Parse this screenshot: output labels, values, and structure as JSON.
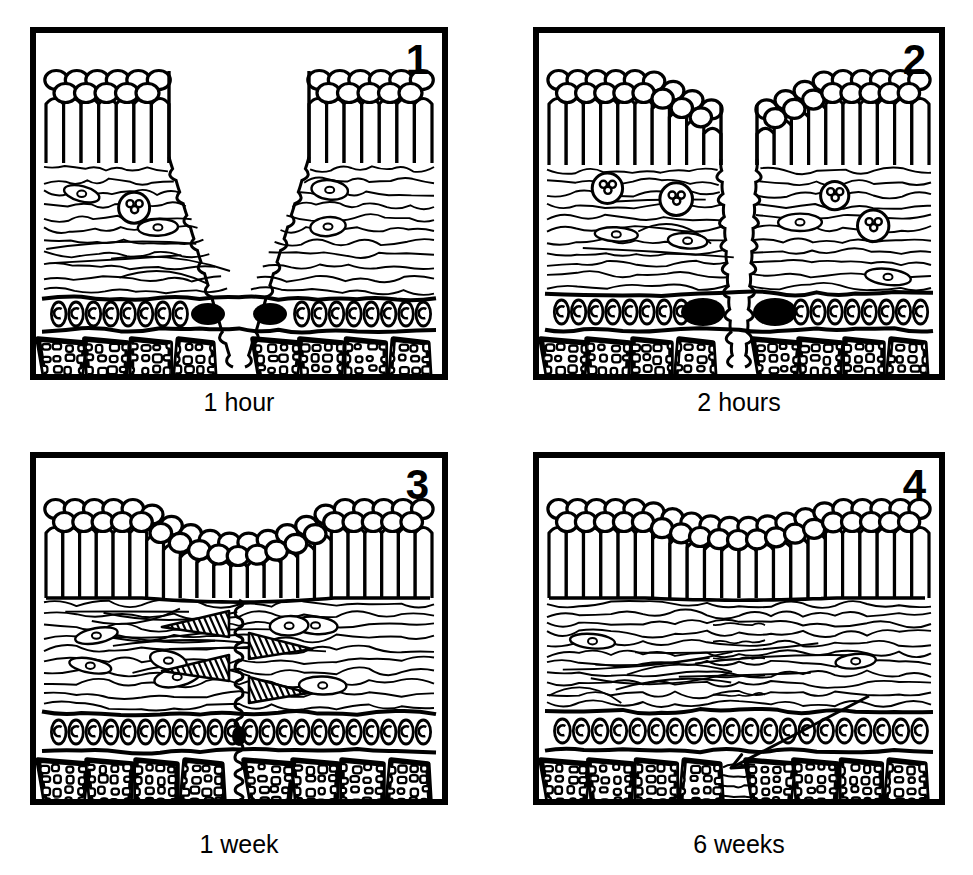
{
  "figure": {
    "background_color": "#ffffff",
    "ink_color": "#000000",
    "width": 973,
    "height": 875,
    "style": "black-and-white line drawing"
  },
  "panels": [
    {
      "id": "panel-1",
      "number": "1",
      "caption": "1 hour",
      "stage": "initial-incision",
      "x": 30,
      "y": 27,
      "w": 418,
      "h": 353,
      "caption_y": 388,
      "description": "Full-thickness V-shaped incision open from epithelial surface through connective tissue to bone",
      "wound": {
        "shape": "v-cleft",
        "top_half_width": 70,
        "bottom_half_width": 6,
        "open": true,
        "epithelium_bridged": false
      },
      "layers": {
        "epithelium": {
          "top": 38,
          "bottom": 130,
          "surface_cells": 22,
          "basal_cells": 26,
          "continuous": false
        },
        "connective_tissue": {
          "top": 130,
          "bottom": 262,
          "fiber_rows": 11,
          "fibroblasts": 5,
          "inflammatory_cells": 2,
          "scar_wedges": 0
        },
        "vessel_band": {
          "top": 262,
          "bottom": 300,
          "cells": 22,
          "clot_blobs": 2
        },
        "bone": {
          "top": 300,
          "bottom": 353,
          "trabeculae": 8
        }
      },
      "annotations": []
    },
    {
      "id": "panel-2",
      "number": "2",
      "caption": "2 hours",
      "stage": "epithelial-migration",
      "x": 533,
      "y": 27,
      "w": 412,
      "h": 353,
      "caption_y": 388,
      "description": "Epithelial margins thicken and migrate down over the wound edge; cleft narrowed; clot blobs enlarged",
      "wound": {
        "shape": "narrow-slit",
        "top_half_width": 18,
        "bottom_half_width": 6,
        "open": true,
        "epithelium_bridged": false
      },
      "layers": {
        "epithelium": {
          "top": 38,
          "bottom": 132,
          "surface_cells": 22,
          "basal_cells": 26,
          "continuous": false,
          "migrating_tongue": true
        },
        "connective_tissue": {
          "top": 132,
          "bottom": 258,
          "fiber_rows": 11,
          "fibroblasts": 4,
          "inflammatory_cells": 4,
          "scar_wedges": 0
        },
        "vessel_band": {
          "top": 258,
          "bottom": 300,
          "cells": 22,
          "clot_blobs": 2,
          "clot_size": "large"
        },
        "bone": {
          "top": 300,
          "bottom": 353,
          "trabeculae": 8
        }
      },
      "annotations": []
    },
    {
      "id": "panel-3",
      "number": "3",
      "caption": "1 week",
      "stage": "granulation-and-reepithelialization",
      "x": 30,
      "y": 452,
      "w": 418,
      "h": 353,
      "caption_y": 830,
      "description": "Epithelium continuous across wound with shallow surface dip; vertical scar track through connective tissue with hatched new collagen wedges",
      "wound": {
        "shape": "vertical-scar-line",
        "top_half_width": 0,
        "bottom_half_width": 3,
        "open": false,
        "epithelium_bridged": true,
        "surface_dip_depth": 34
      },
      "layers": {
        "epithelium": {
          "top": 42,
          "bottom": 140,
          "surface_cells": 20,
          "basal_cells": 24,
          "continuous": true
        },
        "connective_tissue": {
          "top": 140,
          "bottom": 252,
          "fiber_rows": 10,
          "fibroblasts": 7,
          "inflammatory_cells": 0,
          "scar_wedges": 4
        },
        "vessel_band": {
          "top": 252,
          "bottom": 296,
          "cells": 22,
          "clot_blobs": 0,
          "scar_knot": true
        },
        "bone": {
          "top": 296,
          "bottom": 353,
          "trabeculae": 8
        }
      },
      "annotations": []
    },
    {
      "id": "panel-4",
      "number": "4",
      "caption": "6 weeks",
      "stage": "remodelled-scar",
      "x": 533,
      "y": 452,
      "w": 412,
      "h": 353,
      "caption_y": 830,
      "description": "Tissue fully restored; only a faint residual scar remains in the bone, indicated by an arrow",
      "wound": {
        "shape": "residual-scar",
        "top_half_width": 0,
        "bottom_half_width": 0,
        "open": false,
        "epithelium_bridged": true,
        "surface_dip_depth": 18
      },
      "layers": {
        "epithelium": {
          "top": 42,
          "bottom": 140,
          "surface_cells": 21,
          "basal_cells": 25,
          "continuous": true
        },
        "connective_tissue": {
          "top": 140,
          "bottom": 250,
          "fiber_rows": 11,
          "fibroblasts": 2,
          "inflammatory_cells": 0,
          "scar_wedges": 0
        },
        "vessel_band": {
          "top": 250,
          "bottom": 296,
          "cells": 20,
          "clot_blobs": 0
        },
        "bone": {
          "top": 296,
          "bottom": 353,
          "trabeculae": 8,
          "scar_gap": true
        }
      },
      "annotations": [
        {
          "type": "arrow",
          "name": "residual-scar-arrow",
          "from_x": 330,
          "from_y": 238,
          "to_x": 192,
          "to_y": 310,
          "points_to": "residual bone scar"
        }
      ]
    }
  ]
}
